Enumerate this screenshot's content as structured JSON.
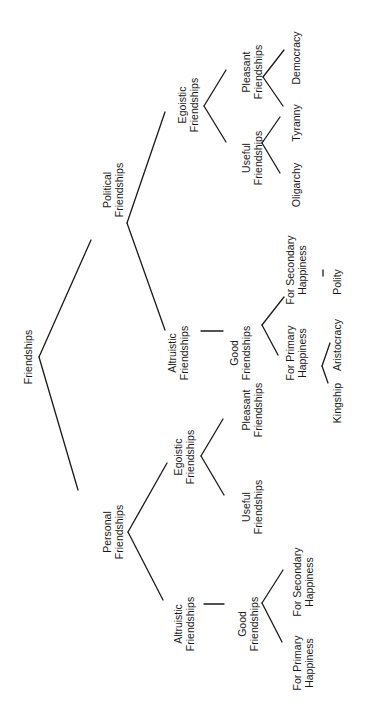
{
  "title": "Friendships",
  "nodes": {
    "root": {
      "lines": [
        "Friendships"
      ],
      "x": 28,
      "y": 357
    },
    "political": {
      "lines": [
        "Political",
        "Friendships"
      ],
      "x": 113,
      "y": 190
    },
    "political_altruistic": {
      "lines": [
        "Altruistic",
        "Friendships"
      ],
      "x": 178,
      "y": 353
    },
    "political_good": {
      "lines": [
        "Good",
        "Friendships"
      ],
      "x": 240,
      "y": 353
    },
    "political_primary": {
      "lines": [
        "For Primary",
        "Happiness"
      ],
      "x": 296,
      "y": 353
    },
    "political_secondary": {
      "lines": [
        "For Secondary",
        "Happiness"
      ],
      "x": 296,
      "y": 270
    },
    "kingship": {
      "lines": [
        "Kingship"
      ],
      "x": 337,
      "y": 403
    },
    "aristocracy": {
      "lines": [
        "Aristocracy"
      ],
      "x": 337,
      "y": 345
    },
    "polity": {
      "lines": [
        "Polity"
      ],
      "x": 337,
      "y": 282
    },
    "political_egoistic": {
      "lines": [
        "Egoistic",
        "Friendships"
      ],
      "x": 188,
      "y": 105
    },
    "political_useful": {
      "lines": [
        "Useful",
        "Friendships"
      ],
      "x": 252,
      "y": 158
    },
    "political_pleasant": {
      "lines": [
        "Pleasant",
        "Friendships"
      ],
      "x": 252,
      "y": 72
    },
    "oligarchy": {
      "lines": [
        "Oligarchy"
      ],
      "x": 296,
      "y": 185
    },
    "tyranny": {
      "lines": [
        "Tyranny"
      ],
      "x": 296,
      "y": 123
    },
    "democracy": {
      "lines": [
        "Democracy"
      ],
      "x": 296,
      "y": 58
    },
    "personal": {
      "lines": [
        "Personal",
        "Friendships"
      ],
      "x": 113,
      "y": 532
    },
    "personal_egoistic": {
      "lines": [
        "Egoistic",
        "Friendships"
      ],
      "x": 184,
      "y": 457
    },
    "personal_useful": {
      "lines": [
        "Useful",
        "Friendships"
      ],
      "x": 252,
      "y": 507
    },
    "personal_pleasant": {
      "lines": [
        "Pleasant",
        "Friendships"
      ],
      "x": 252,
      "y": 410
    },
    "personal_altruistic": {
      "lines": [
        "Altruistic",
        "Friendships"
      ],
      "x": 184,
      "y": 624
    },
    "personal_good": {
      "lines": [
        "Good",
        "Friendships"
      ],
      "x": 248,
      "y": 624
    },
    "personal_primary": {
      "lines": [
        "For Primary",
        "Happiness"
      ],
      "x": 303,
      "y": 663
    },
    "personal_secondary": {
      "lines": [
        "For Secondary",
        "Happiness"
      ],
      "x": 303,
      "y": 582
    }
  },
  "edges": [
    {
      "from": "root",
      "to": "political",
      "x1": 39,
      "y1": 357,
      "x2": 91,
      "y2": 240
    },
    {
      "from": "root",
      "to": "personal",
      "x1": 39,
      "y1": 357,
      "x2": 78,
      "y2": 490
    },
    {
      "from": "political",
      "to": "political_egoistic",
      "x1": 127,
      "y1": 223,
      "x2": 165,
      "y2": 112
    },
    {
      "from": "political",
      "to": "political_altruistic",
      "x1": 127,
      "y1": 223,
      "x2": 165,
      "y2": 330
    },
    {
      "from": "political_altruistic",
      "to": "political_good",
      "x1": 201,
      "y1": 331,
      "x2": 223,
      "y2": 331
    },
    {
      "from": "political_good",
      "to": "political_primary",
      "x1": 262,
      "y1": 325,
      "x2": 278,
      "y2": 355
    },
    {
      "from": "political_good",
      "to": "political_secondary",
      "x1": 262,
      "y1": 325,
      "x2": 284,
      "y2": 297
    },
    {
      "from": "political_primary",
      "to": "kingship",
      "x1": 322,
      "y1": 366,
      "x2": 328,
      "y2": 383
    },
    {
      "from": "political_primary",
      "to": "aristocracy",
      "x1": 322,
      "y1": 366,
      "x2": 330,
      "y2": 343
    },
    {
      "from": "political_secondary",
      "to": "polity",
      "x1": 323,
      "y1": 270,
      "x2": 323,
      "y2": 276
    },
    {
      "from": "political_egoistic",
      "to": "political_useful",
      "x1": 204,
      "y1": 106,
      "x2": 226,
      "y2": 142
    },
    {
      "from": "political_egoistic",
      "to": "political_pleasant",
      "x1": 204,
      "y1": 106,
      "x2": 226,
      "y2": 70
    },
    {
      "from": "political_useful",
      "to": "oligarchy",
      "x1": 262,
      "y1": 143,
      "x2": 280,
      "y2": 173
    },
    {
      "from": "political_useful",
      "to": "tyranny",
      "x1": 262,
      "y1": 143,
      "x2": 280,
      "y2": 117
    },
    {
      "from": "political_pleasant",
      "to": "tyranny",
      "x1": 263,
      "y1": 77,
      "x2": 283,
      "y2": 106
    },
    {
      "from": "political_pleasant",
      "to": "democracy",
      "x1": 263,
      "y1": 77,
      "x2": 284,
      "y2": 50
    },
    {
      "from": "personal",
      "to": "personal_egoistic",
      "x1": 128,
      "y1": 532,
      "x2": 167,
      "y2": 463
    },
    {
      "from": "personal",
      "to": "personal_altruistic",
      "x1": 128,
      "y1": 532,
      "x2": 163,
      "y2": 600
    },
    {
      "from": "personal_egoistic",
      "to": "personal_useful",
      "x1": 201,
      "y1": 456,
      "x2": 224,
      "y2": 495
    },
    {
      "from": "personal_egoistic",
      "to": "personal_pleasant",
      "x1": 201,
      "y1": 456,
      "x2": 223,
      "y2": 419
    },
    {
      "from": "personal_altruistic",
      "to": "personal_good",
      "x1": 204,
      "y1": 604,
      "x2": 224,
      "y2": 604
    },
    {
      "from": "personal_good",
      "to": "personal_primary",
      "x1": 262,
      "y1": 603,
      "x2": 282,
      "y2": 642
    },
    {
      "from": "personal_good",
      "to": "personal_secondary",
      "x1": 262,
      "y1": 603,
      "x2": 283,
      "y2": 570
    }
  ]
}
